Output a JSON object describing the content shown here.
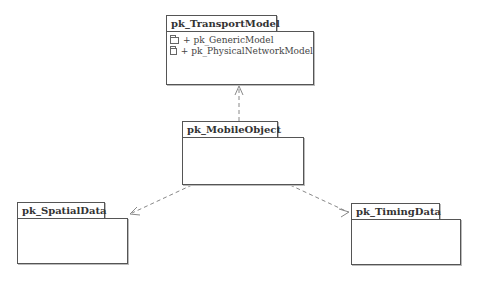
{
  "diagram": {
    "type": "UML package diagram",
    "packages": [
      {
        "id": "transport",
        "name": "pk_TransportModel",
        "members": [
          "+ pk_GenericModel",
          "+ pk_PhysicalNetworkModel"
        ]
      },
      {
        "id": "mobile",
        "name": "pk_MobileObject",
        "members": []
      },
      {
        "id": "spatial",
        "name": "pk_SpatialData",
        "members": []
      },
      {
        "id": "timing",
        "name": "pk_TimingData",
        "members": []
      }
    ],
    "dependencies": [
      {
        "from": "pk_MobileObject",
        "to": "pk_TransportModel",
        "style": "dashed-open-arrow"
      },
      {
        "from": "pk_MobileObject",
        "to": "pk_SpatialData",
        "style": "dashed-open-arrow"
      },
      {
        "from": "pk_MobileObject",
        "to": "pk_TimingData",
        "style": "dashed-open-arrow"
      }
    ],
    "colors": {
      "line": "#555555",
      "text": "#333333",
      "background": "#ffffff"
    }
  }
}
